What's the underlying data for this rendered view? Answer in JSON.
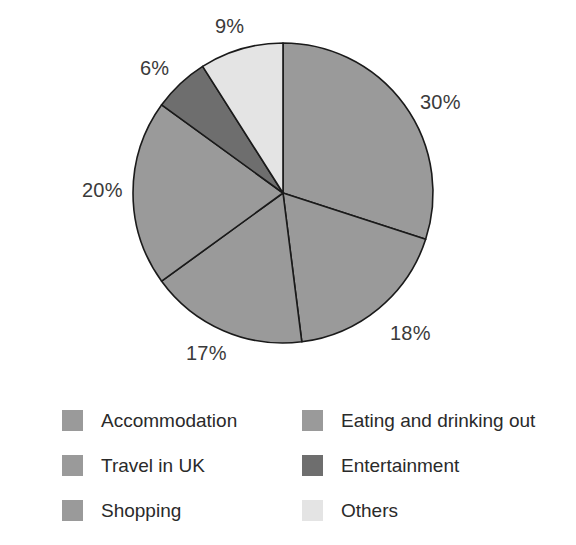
{
  "chart_data": {
    "type": "pie",
    "title": "",
    "subtitle": "",
    "xlabel": "",
    "ylabel": "",
    "grid": false,
    "legend_position": "bottom",
    "start_angle_deg": 0,
    "direction": "clockwise",
    "unit": "%",
    "categories": [
      "Accommodation",
      "Eating and drinking out",
      "Shopping",
      "Travel in UK",
      "Entertainment",
      "Others"
    ],
    "values": [
      30,
      18,
      17,
      20,
      6,
      9
    ],
    "colors": [
      "#9a9a9a",
      "#9a9a9a",
      "#9a9a9a",
      "#9a9a9a",
      "#6e6e6e",
      "#e4e4e4"
    ],
    "slices": [
      {
        "label": "Accommodation",
        "value": 30,
        "display": "30%",
        "color": "#9a9a9a",
        "label_x": 420,
        "label_y": 92
      },
      {
        "label": "Eating and drinking out",
        "value": 18,
        "display": "18%",
        "color": "#9a9a9a",
        "label_x": 390,
        "label_y": 323
      },
      {
        "label": "Shopping",
        "value": 17,
        "display": "17%",
        "color": "#9a9a9a",
        "label_x": 186,
        "label_y": 343
      },
      {
        "label": "Travel in UK",
        "value": 20,
        "display": "20%",
        "color": "#9a9a9a",
        "label_x": 82,
        "label_y": 180
      },
      {
        "label": "Entertainment",
        "value": 6,
        "display": "6%",
        "color": "#6e6e6e",
        "label_x": 140,
        "label_y": 58
      },
      {
        "label": "Others",
        "value": 9,
        "display": "9%",
        "color": "#e4e4e4",
        "label_x": 215,
        "label_y": 16
      }
    ],
    "geometry": {
      "center_x": 283,
      "center_y": 193,
      "radius": 150,
      "stroke": "#1a1a1a",
      "stroke_width": 1.6
    }
  },
  "legend": {
    "items": [
      {
        "label": "Accommodation",
        "color": "#9a9a9a"
      },
      {
        "label": "Eating and drinking out",
        "color": "#9a9a9a"
      },
      {
        "label": "Travel in UK",
        "color": "#9a9a9a"
      },
      {
        "label": "Entertainment",
        "color": "#6e6e6e"
      },
      {
        "label": "Shopping",
        "color": "#9a9a9a"
      },
      {
        "label": "Others",
        "color": "#e4e4e4"
      }
    ]
  },
  "background": "#ffffff"
}
